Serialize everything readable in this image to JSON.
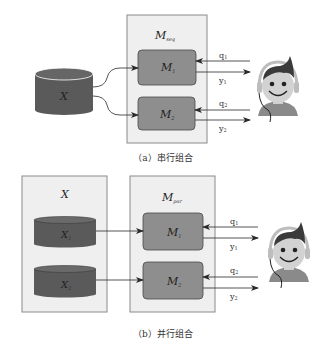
{
  "diagram_a": {
    "container_label": "M",
    "container_sub": "seq",
    "data_label": "X",
    "models": [
      {
        "label": "M",
        "sub": "1"
      },
      {
        "label": "M",
        "sub": "2"
      }
    ],
    "io": [
      {
        "query": "q",
        "query_sub": "1",
        "output": "y",
        "output_sub": "1"
      },
      {
        "query": "q",
        "query_sub": "2",
        "output": "y",
        "output_sub": "2"
      }
    ],
    "caption": "（a）串行组合"
  },
  "diagram_b": {
    "data_container_label": "X",
    "container_label": "M",
    "container_sub": "par",
    "data_parts": [
      {
        "label": "X",
        "sub": "1"
      },
      {
        "label": "X",
        "sub": "2"
      }
    ],
    "models": [
      {
        "label": "M",
        "sub": "1"
      },
      {
        "label": "M",
        "sub": "2"
      }
    ],
    "io": [
      {
        "query": "q",
        "query_sub": "1",
        "output": "y",
        "output_sub": "1"
      },
      {
        "query": "q",
        "query_sub": "2",
        "output": "y",
        "output_sub": "2"
      }
    ],
    "caption": "（b）并行组合"
  },
  "colors": {
    "container_fill": "#efefef",
    "container_stroke": "#8a8a8a",
    "model_fill": "#8e8e8e",
    "model_stroke": "#4a4a4a",
    "cylinder_fill": "#5a5a5a",
    "cylinder_top": "#6a6a6a",
    "arrow": "#2a2a2a"
  }
}
